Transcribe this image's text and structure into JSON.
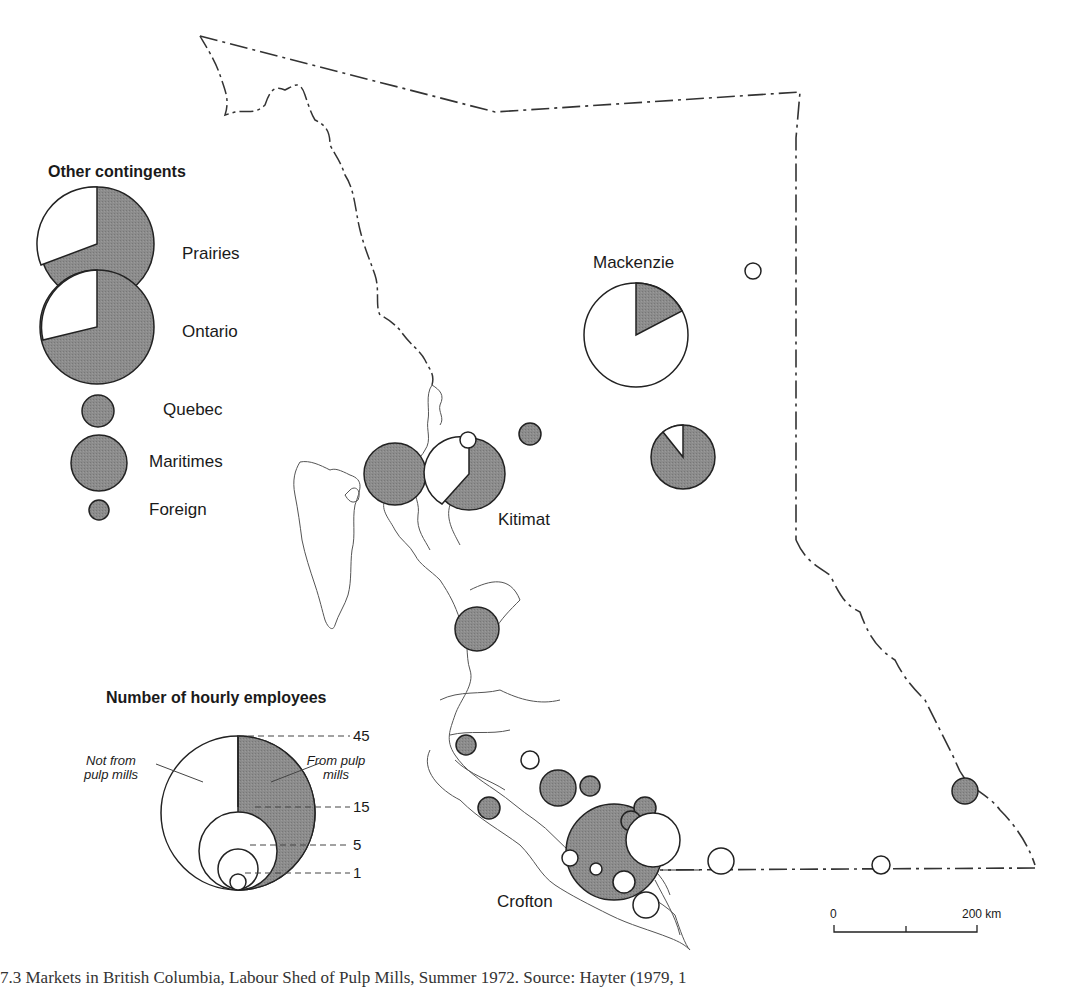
{
  "colors": {
    "pulp": "#8a8a8a",
    "nonpulp": "#ffffff",
    "stroke": "#2a2a2a",
    "coast": "#444444"
  },
  "legend_contingents": {
    "title": "Other contingents",
    "items": [
      {
        "label": "Prairies",
        "pulp_share": 0.72
      },
      {
        "label": "Ontario",
        "pulp_share": 0.71
      },
      {
        "label": "Quebec",
        "pulp_share": 1.0
      },
      {
        "label": "Maritimes",
        "pulp_share": 1.0
      },
      {
        "label": "Foreign",
        "pulp_share": 1.0
      }
    ]
  },
  "legend_size": {
    "title": "Number of hourly employees",
    "ticks": [
      "45",
      "15",
      "5",
      "1"
    ],
    "not_from_label": "Not from pulp mills",
    "from_label": "From pulp mills"
  },
  "places": {
    "mackenzie": "Mackenzie",
    "kitimat": "Kitimat",
    "crofton": "Crofton"
  },
  "scale_bar": {
    "start": "0",
    "end": "200 km"
  },
  "symbols": [
    {
      "name": "mackenzie-pie",
      "employees": 45,
      "pulp_share": 0.17
    },
    {
      "name": "prince-george-pie",
      "employees": 20,
      "pulp_share": 0.92
    },
    {
      "name": "kitimat-pie",
      "employees": 25,
      "pulp_share": 0.64
    },
    {
      "name": "prince-rupert-circle",
      "employees": 20,
      "pulp_share": 1.0
    },
    {
      "name": "ocean-falls-circle",
      "employees": 12,
      "pulp_share": 1.0
    },
    {
      "name": "crofton-circle",
      "employees": 45,
      "pulp_share": 1.0
    },
    {
      "name": "nelson-circle",
      "employees": 3,
      "pulp_share": 1.0
    }
  ],
  "caption": "7.3  Markets in British Columbia, Labour Shed of Pulp Mills, Summer 1972. Source: Hayter (1979, 1"
}
